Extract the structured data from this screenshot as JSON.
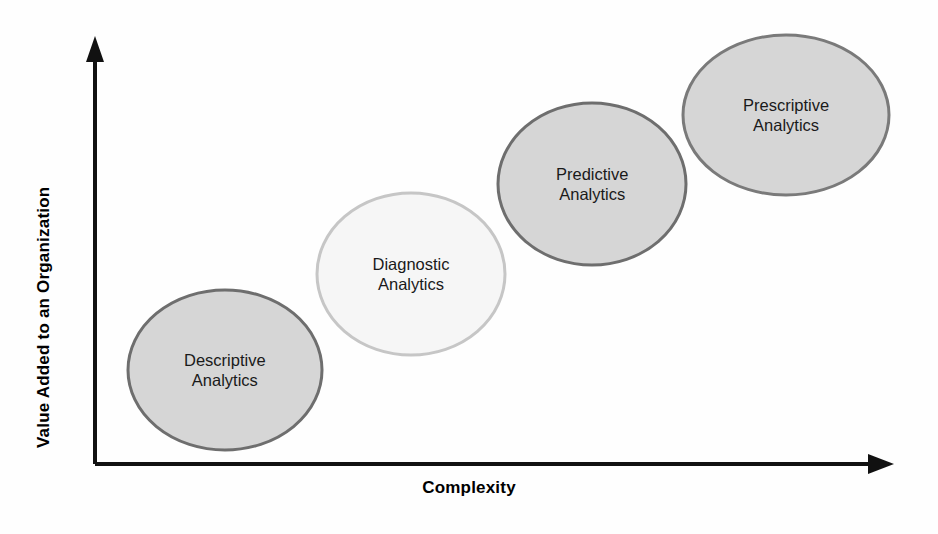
{
  "axes": {
    "x_label": "Complexity",
    "y_label": "Value Added to an Organization",
    "axis_color": "#111111"
  },
  "bubbles": [
    {
      "id": "descriptive",
      "line1": "Descriptive",
      "line2": "Analytics",
      "fill": "#d6d6d6",
      "stroke": "#6e6e6e",
      "cx": 225,
      "cy": 370,
      "rx": 97,
      "ry": 80
    },
    {
      "id": "diagnostic",
      "line1": "Diagnostic",
      "line2": "Analytics",
      "fill": "#f6f6f6",
      "stroke": "#c6c6c6",
      "cx": 411,
      "cy": 274,
      "rx": 94,
      "ry": 81
    },
    {
      "id": "predictive",
      "line1": "Predictive",
      "line2": "Analytics",
      "fill": "#d6d6d6",
      "stroke": "#6e6e6e",
      "cx": 592,
      "cy": 184,
      "rx": 94,
      "ry": 81
    },
    {
      "id": "prescriptive",
      "line1": "Prescriptive",
      "line2": "Analytics",
      "fill": "#d6d6d6",
      "stroke": "#7a7a7a",
      "cx": 786,
      "cy": 115,
      "rx": 103,
      "ry": 80
    }
  ],
  "chart_data": {
    "type": "scatter",
    "xlabel": "Complexity",
    "ylabel": "Value Added to an Organization",
    "grid": false,
    "legend": "none",
    "xlim": [
      0,
      10
    ],
    "ylim": [
      0,
      10
    ],
    "annotations": [
      "Descriptive Analytics",
      "Diagnostic Analytics",
      "Predictive Analytics",
      "Prescriptive Analytics"
    ],
    "points": [
      {
        "label": "Descriptive Analytics",
        "x": 1.6,
        "y": 2.3
      },
      {
        "label": "Diagnostic Analytics",
        "x": 4.0,
        "y": 4.5
      },
      {
        "label": "Predictive Analytics",
        "x": 6.2,
        "y": 6.7
      },
      {
        "label": "Prescriptive Analytics",
        "x": 8.8,
        "y": 8.3
      }
    ]
  }
}
